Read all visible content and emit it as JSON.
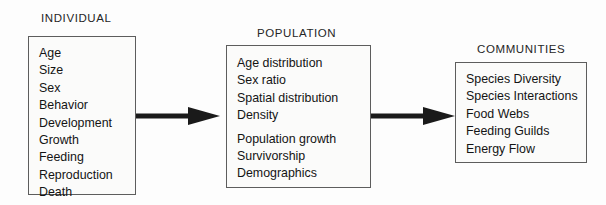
{
  "diagram": {
    "type": "flow",
    "accent_color": "#1a1a1a",
    "box_border_color": "#5d5d5d",
    "box_fill_color": "#fbfbfa",
    "levels": [
      {
        "id": "individual",
        "heading": "INDIVIDUAL",
        "items": [
          {
            "label": "Age",
            "gap_before": false
          },
          {
            "label": "Size",
            "gap_before": false
          },
          {
            "label": "Sex",
            "gap_before": false
          },
          {
            "label": "Behavior",
            "gap_before": false
          },
          {
            "label": "Development",
            "gap_before": false
          },
          {
            "label": "Growth",
            "gap_before": false
          },
          {
            "label": "Feeding",
            "gap_before": false
          },
          {
            "label": "Reproduction",
            "gap_before": false
          },
          {
            "label": "Death",
            "gap_before": false
          }
        ]
      },
      {
        "id": "population",
        "heading": "POPULATION",
        "items": [
          {
            "label": "Age distribution",
            "gap_before": false
          },
          {
            "label": "Sex ratio",
            "gap_before": false
          },
          {
            "label": "Spatial distribution",
            "gap_before": false
          },
          {
            "label": "Density",
            "gap_before": false
          },
          {
            "label": "Population growth",
            "gap_before": true
          },
          {
            "label": "Survivorship",
            "gap_before": false
          },
          {
            "label": "Demographics",
            "gap_before": false
          }
        ]
      },
      {
        "id": "communities",
        "heading": "COMMUNITIES",
        "items": [
          {
            "label": "Species Diversity",
            "gap_before": false
          },
          {
            "label": "Species Interactions",
            "gap_before": false
          },
          {
            "label": "Food Webs",
            "gap_before": false
          },
          {
            "label": "Feeding Guilds",
            "gap_before": false
          },
          {
            "label": "Energy Flow",
            "gap_before": false
          }
        ]
      }
    ],
    "connectors": [
      {
        "id": "individual-to-population",
        "from": "individual",
        "to": "population",
        "style": "solid-arrow-right"
      },
      {
        "id": "population-to-communities",
        "from": "population",
        "to": "communities",
        "style": "solid-arrow-right"
      }
    ]
  }
}
